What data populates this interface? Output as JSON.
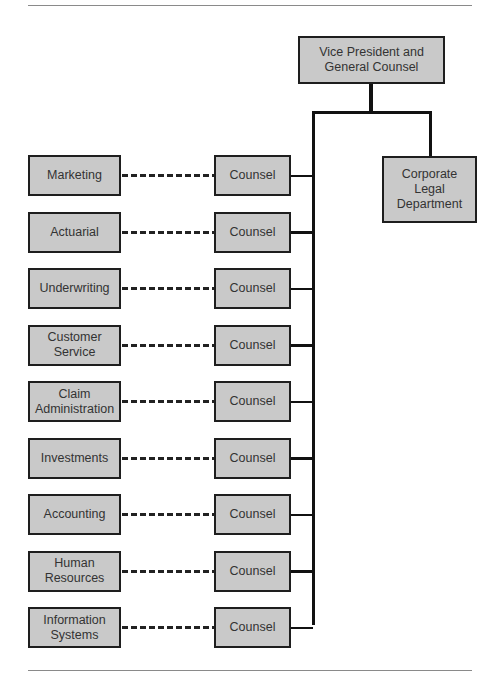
{
  "chart": {
    "top": {
      "label": "Vice President and\nGeneral Counsel"
    },
    "legal": {
      "label": "Corporate\nLegal\nDepartment"
    },
    "rows": [
      {
        "department": "Marketing",
        "counsel": "Counsel"
      },
      {
        "department": "Actuarial",
        "counsel": "Counsel"
      },
      {
        "department": "Underwriting",
        "counsel": "Counsel"
      },
      {
        "department": "Customer\nService",
        "counsel": "Counsel"
      },
      {
        "department": "Claim\nAdministration",
        "counsel": "Counsel"
      },
      {
        "department": "Investments",
        "counsel": "Counsel"
      },
      {
        "department": "Accounting",
        "counsel": "Counsel"
      },
      {
        "department": "Human\nResources",
        "counsel": "Counsel"
      },
      {
        "department": "Information\nSystems",
        "counsel": "Counsel"
      }
    ]
  }
}
